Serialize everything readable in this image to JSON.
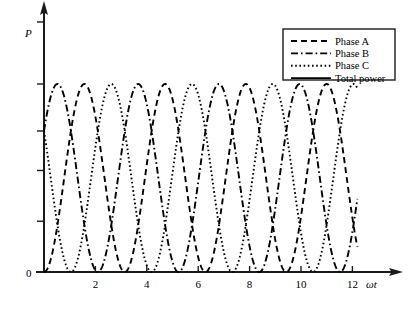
{
  "chart_data": {
    "type": "line",
    "title": "",
    "xlabel": "ωt",
    "ylabel": "P",
    "xlim": [
      -0.12,
      13.9
    ],
    "ylim": [
      0,
      1.62
    ],
    "grid": false,
    "legend_position": "top-right",
    "x_ticks": [
      2,
      4,
      6,
      8,
      10,
      12
    ],
    "x_tick_labels": [
      "2",
      "4",
      "6",
      "8",
      "10",
      "12"
    ],
    "y_ticks": [
      0,
      0.27,
      0.54,
      0.75,
      1.0,
      1.33
    ],
    "y_tick_labels": [
      "0",
      "",
      "",
      "",
      "",
      ""
    ],
    "y_origin_label": "0",
    "series": [
      {
        "name": "Phase A",
        "style": "dashed",
        "color": "#000000",
        "formula": "sin(x)^2",
        "amplitude": 1.0,
        "period": 3.1416,
        "phase_deg": 0,
        "x_start": 0,
        "x_end": 12.2
      },
      {
        "name": "Phase B",
        "style": "dash-dot",
        "color": "#000000",
        "formula": "sin(x - 2*pi/3)^2",
        "amplitude": 1.0,
        "period": 3.1416,
        "phase_deg": -120,
        "x_start": 0,
        "x_end": 12.2
      },
      {
        "name": "Phase C",
        "style": "dotted",
        "color": "#000000",
        "formula": "sin(x + 2*pi/3)^2",
        "amplitude": 1.0,
        "period": 3.1416,
        "phase_deg": 120,
        "x_start": 0,
        "x_end": 12.2
      },
      {
        "name": "Total power",
        "style": "solid",
        "color": "#000000",
        "formula": "1.5 (constant)",
        "amplitude": 1.5,
        "constant_value": 1.5,
        "x_start": 0,
        "x_end": 13.6
      }
    ]
  },
  "legend": {
    "items": [
      {
        "label": "Phase A",
        "style": "dashed"
      },
      {
        "label": "Phase B",
        "style": "dash-dot"
      },
      {
        "label": "Phase C",
        "style": "dotted"
      },
      {
        "label": "Total power",
        "style": "solid"
      }
    ]
  },
  "axes": {
    "y_axis_label": "P",
    "x_axis_label": "ωt",
    "zero_label": "0"
  }
}
